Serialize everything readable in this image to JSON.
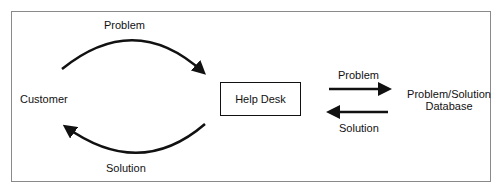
{
  "diagram": {
    "nodes": {
      "customer": "Customer",
      "help_desk": "Help Desk",
      "database_line1": "Problem/Solution",
      "database_line2": "Database"
    },
    "edges": {
      "customer_to_helpdesk": "Problem",
      "helpdesk_to_customer": "Solution",
      "helpdesk_to_database": "Problem",
      "database_to_helpdesk": "Solution"
    },
    "colors": {
      "stroke": "#111111",
      "frame": "#8a8a8a",
      "background": "#ffffff"
    }
  }
}
